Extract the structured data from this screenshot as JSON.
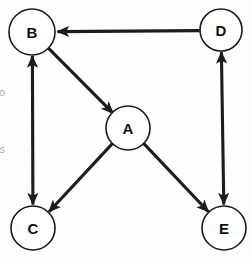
{
  "diagram": {
    "background_color": "#fefefe",
    "node_fill": "#ffffff",
    "node_stroke": "#1a1a1a",
    "edge_color": "#1c1c1c",
    "label_color": "#111111",
    "nodes": [
      {
        "id": "B",
        "label": "B",
        "cx": 32,
        "cy": 32,
        "r": 23
      },
      {
        "id": "D",
        "label": "D",
        "cx": 221,
        "cy": 30,
        "r": 21
      },
      {
        "id": "A",
        "label": "A",
        "cx": 128,
        "cy": 128,
        "r": 22
      },
      {
        "id": "C",
        "label": "C",
        "cx": 33,
        "cy": 228,
        "r": 22
      },
      {
        "id": "E",
        "label": "E",
        "cx": 224,
        "cy": 228,
        "r": 22
      }
    ],
    "edges": [
      {
        "id": "D-B",
        "from": "D",
        "to": "B",
        "direction": "one-way",
        "arrow_at": "to"
      },
      {
        "id": "B-A",
        "from": "B",
        "to": "A",
        "direction": "one-way",
        "arrow_at": "to"
      },
      {
        "id": "B-C",
        "from": "B",
        "to": "C",
        "direction": "bidirectional",
        "arrow_at": "both"
      },
      {
        "id": "A-C",
        "from": "A",
        "to": "C",
        "direction": "one-way",
        "arrow_at": "to"
      },
      {
        "id": "A-E",
        "from": "A",
        "to": "E",
        "direction": "one-way",
        "arrow_at": "to"
      },
      {
        "id": "D-E",
        "from": "D",
        "to": "E",
        "direction": "bidirectional",
        "arrow_at": "both"
      }
    ],
    "margin_fragments": [
      {
        "id": "frag-top",
        "text": "o",
        "x": 0,
        "y": 92
      },
      {
        "id": "frag-bottom",
        "text": "s",
        "x": 0,
        "y": 149
      }
    ]
  }
}
